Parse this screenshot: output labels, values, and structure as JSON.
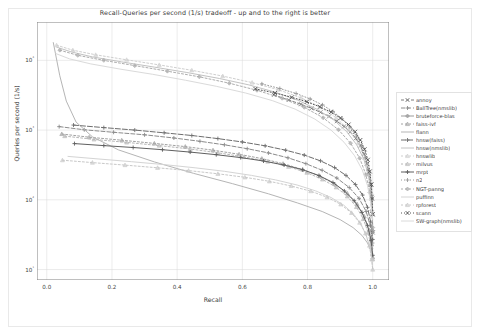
{
  "chart_data": {
    "type": "line",
    "title": "Recall-Queries per second (1/s) tradeoff - up and to the right is better",
    "xlabel": "Recall",
    "ylabel": "Queries per second (1/s)",
    "xlim": [
      -0.03,
      1.05
    ],
    "ylim_log10": [
      0.85,
      4.55
    ],
    "xscale": "linear",
    "yscale": "log",
    "grid": true,
    "xticks": [
      "0.0",
      "0.2",
      "0.4",
      "0.6",
      "0.8",
      "1.0"
    ],
    "xtick_values": [
      0.0,
      0.2,
      0.4,
      0.6,
      0.8,
      1.0
    ],
    "yticks": [
      "10⁴",
      "10³",
      "10²",
      "10¹"
    ],
    "ytick_values": [
      10000,
      1000,
      100,
      10
    ],
    "legend_position": "right outside",
    "series": [
      {
        "name": "annoy",
        "color": "#7d7d7d",
        "marker": "star",
        "dash": "3,2",
        "points": [
          [
            0.697,
            3200
          ],
          [
            0.742,
            2700
          ],
          [
            0.78,
            2350
          ],
          [
            0.812,
            2050
          ],
          [
            0.84,
            1800
          ],
          [
            0.866,
            1570
          ],
          [
            0.89,
            1340
          ],
          [
            0.912,
            1130
          ],
          [
            0.931,
            940
          ],
          [
            0.948,
            760
          ],
          [
            0.962,
            600
          ],
          [
            0.973,
            455
          ],
          [
            0.982,
            330
          ],
          [
            0.989,
            235
          ],
          [
            0.994,
            165
          ],
          [
            0.997,
            110
          ],
          [
            0.999,
            62
          ],
          [
            1.0,
            34
          ]
        ]
      },
      {
        "name": "BallTree(nmslib)",
        "color": "#8c8c8c",
        "marker": "plus",
        "dash": "4,2",
        "points": [
          [
            0.038,
            1120
          ],
          [
            0.115,
            1010
          ],
          [
            0.205,
            930
          ],
          [
            0.3,
            855
          ],
          [
            0.39,
            770
          ],
          [
            0.47,
            690
          ],
          [
            0.545,
            615
          ],
          [
            0.615,
            540
          ],
          [
            0.68,
            470
          ],
          [
            0.74,
            400
          ],
          [
            0.795,
            330
          ],
          [
            0.845,
            265
          ],
          [
            0.89,
            205
          ],
          [
            0.928,
            150
          ],
          [
            0.958,
            105
          ],
          [
            0.98,
            68
          ],
          [
            0.993,
            42
          ],
          [
            0.999,
            24
          ]
        ]
      },
      {
        "name": "bruteforce-blas",
        "color": "#9b9b9b",
        "marker": "diamond",
        "dash": "none",
        "points": [
          [
            1.0,
            36
          ]
        ]
      },
      {
        "name": "faiss-ivf",
        "color": "#a2a2a2",
        "marker": "tri",
        "dash": "2,2",
        "points": [
          [
            0.046,
            880
          ],
          [
            0.13,
            790
          ],
          [
            0.23,
            715
          ],
          [
            0.33,
            645
          ],
          [
            0.425,
            580
          ],
          [
            0.51,
            515
          ],
          [
            0.59,
            450
          ],
          [
            0.66,
            390
          ],
          [
            0.725,
            330
          ],
          [
            0.785,
            272
          ],
          [
            0.838,
            218
          ],
          [
            0.884,
            168
          ],
          [
            0.922,
            124
          ],
          [
            0.952,
            87
          ],
          [
            0.974,
            58
          ],
          [
            0.989,
            37
          ],
          [
            0.997,
            23
          ],
          [
            1.0,
            15
          ]
        ]
      },
      {
        "name": "flann",
        "color": "#b5b5b5",
        "marker": "none",
        "dash": "none",
        "points": [
          [
            0.02,
            18000
          ],
          [
            0.04,
            6000
          ],
          [
            0.06,
            2600
          ],
          [
            0.09,
            1300
          ],
          [
            0.14,
            800
          ],
          [
            0.22,
            520
          ],
          [
            0.33,
            350
          ],
          [
            0.45,
            240
          ],
          [
            0.57,
            170
          ],
          [
            0.68,
            122
          ],
          [
            0.77,
            90
          ],
          [
            0.845,
            68
          ],
          [
            0.9,
            52
          ],
          [
            0.94,
            40
          ],
          [
            0.967,
            31
          ],
          [
            0.984,
            24
          ],
          [
            0.994,
            19
          ],
          [
            1.0,
            15
          ]
        ]
      },
      {
        "name": "hnsw(faiss)",
        "color": "#6e6e6e",
        "marker": "plus",
        "dash": "5,2",
        "points": [
          [
            0.082,
            1180
          ],
          [
            0.175,
            1085
          ],
          [
            0.27,
            1000
          ],
          [
            0.36,
            915
          ],
          [
            0.445,
            835
          ],
          [
            0.525,
            755
          ],
          [
            0.6,
            675
          ],
          [
            0.67,
            595
          ],
          [
            0.733,
            515
          ],
          [
            0.79,
            438
          ],
          [
            0.84,
            362
          ],
          [
            0.883,
            290
          ],
          [
            0.918,
            224
          ],
          [
            0.947,
            166
          ],
          [
            0.969,
            117
          ],
          [
            0.984,
            78
          ],
          [
            0.994,
            48
          ],
          [
            1.0,
            27
          ]
        ]
      },
      {
        "name": "hnsw(nmslib)",
        "color": "#c2c2c2",
        "marker": "none",
        "dash": "none",
        "points": [
          [
            0.03,
            15500
          ],
          [
            0.075,
            13200
          ],
          [
            0.14,
            11200
          ],
          [
            0.23,
            9500
          ],
          [
            0.33,
            8000
          ],
          [
            0.43,
            6700
          ],
          [
            0.53,
            5500
          ],
          [
            0.62,
            4450
          ],
          [
            0.7,
            3500
          ],
          [
            0.77,
            2680
          ],
          [
            0.83,
            1980
          ],
          [
            0.88,
            1400
          ],
          [
            0.92,
            950
          ],
          [
            0.951,
            615
          ],
          [
            0.973,
            380
          ],
          [
            0.987,
            220
          ],
          [
            0.995,
            120
          ],
          [
            1.0,
            62
          ]
        ]
      },
      {
        "name": "hnswlib",
        "color": "#cfcfcf",
        "marker": "tri",
        "dash": "2,2",
        "points": [
          [
            0.03,
            16500
          ],
          [
            0.08,
            14000
          ],
          [
            0.15,
            12000
          ],
          [
            0.245,
            10200
          ],
          [
            0.345,
            8600
          ],
          [
            0.445,
            7200
          ],
          [
            0.54,
            5950
          ],
          [
            0.63,
            4800
          ],
          [
            0.71,
            3800
          ],
          [
            0.78,
            2900
          ],
          [
            0.84,
            2130
          ],
          [
            0.888,
            1500
          ],
          [
            0.926,
            1010
          ],
          [
            0.955,
            650
          ],
          [
            0.975,
            400
          ],
          [
            0.988,
            230
          ],
          [
            0.996,
            125
          ],
          [
            1.0,
            64
          ]
        ]
      },
      {
        "name": "milvus",
        "color": "#b8b8b8",
        "marker": "tri",
        "dash": "2,2",
        "points": [
          [
            0.055,
            820
          ],
          [
            0.145,
            735
          ],
          [
            0.245,
            665
          ],
          [
            0.345,
            600
          ],
          [
            0.44,
            535
          ],
          [
            0.525,
            472
          ],
          [
            0.605,
            412
          ],
          [
            0.678,
            354
          ],
          [
            0.742,
            298
          ],
          [
            0.798,
            245
          ],
          [
            0.846,
            196
          ],
          [
            0.888,
            151
          ],
          [
            0.922,
            112
          ],
          [
            0.95,
            79
          ],
          [
            0.971,
            53
          ],
          [
            0.986,
            34
          ],
          [
            0.995,
            21
          ],
          [
            1.0,
            14
          ]
        ]
      },
      {
        "name": "mrpt",
        "color": "#5f5f5f",
        "marker": "plus",
        "dash": "none",
        "points": [
          [
            0.085,
            640
          ],
          [
            0.175,
            600
          ],
          [
            0.265,
            562
          ],
          [
            0.355,
            523
          ],
          [
            0.44,
            484
          ],
          [
            0.52,
            444
          ],
          [
            0.595,
            403
          ],
          [
            0.665,
            360
          ],
          [
            0.728,
            316
          ],
          [
            0.785,
            270
          ],
          [
            0.835,
            223
          ],
          [
            0.878,
            177
          ],
          [
            0.913,
            134
          ],
          [
            0.943,
            97
          ],
          [
            0.967,
            66
          ],
          [
            0.984,
            43
          ],
          [
            0.995,
            26
          ],
          [
            1.0,
            16
          ]
        ]
      },
      {
        "name": "n2",
        "color": "#9a9a9a",
        "marker": "plus",
        "dash": "1,2",
        "points": [
          [
            0.66,
            4600
          ],
          [
            0.715,
            3950
          ],
          [
            0.765,
            3350
          ],
          [
            0.808,
            2800
          ],
          [
            0.846,
            2300
          ],
          [
            0.878,
            1850
          ],
          [
            0.906,
            1450
          ],
          [
            0.93,
            1110
          ],
          [
            0.95,
            820
          ],
          [
            0.966,
            585
          ],
          [
            0.978,
            400
          ],
          [
            0.987,
            265
          ],
          [
            0.993,
            168
          ],
          [
            0.997,
            102
          ],
          [
            0.999,
            60
          ],
          [
            1.0,
            34
          ]
        ]
      },
      {
        "name": "NGT-panng",
        "color": "#adadad",
        "marker": "diamond",
        "dash": "2,2",
        "points": [
          [
            0.04,
            14000
          ],
          [
            0.095,
            11800
          ],
          [
            0.175,
            10000
          ],
          [
            0.27,
            8400
          ],
          [
            0.37,
            7000
          ],
          [
            0.468,
            5800
          ],
          [
            0.56,
            4700
          ],
          [
            0.645,
            3720
          ],
          [
            0.722,
            2860
          ],
          [
            0.79,
            2120
          ],
          [
            0.848,
            1500
          ],
          [
            0.895,
            1010
          ],
          [
            0.932,
            650
          ],
          [
            0.96,
            395
          ],
          [
            0.979,
            230
          ],
          [
            0.991,
            128
          ],
          [
            0.997,
            70
          ],
          [
            1.0,
            40
          ]
        ]
      },
      {
        "name": "puffinn",
        "color": "#d4d4d4",
        "marker": "none",
        "dash": "none",
        "points": [
          [
            0.065,
            420
          ],
          [
            0.16,
            385
          ],
          [
            0.26,
            352
          ],
          [
            0.36,
            320
          ],
          [
            0.455,
            288
          ],
          [
            0.545,
            256
          ],
          [
            0.628,
            224
          ],
          [
            0.702,
            193
          ],
          [
            0.768,
            163
          ],
          [
            0.825,
            134
          ],
          [
            0.872,
            108
          ],
          [
            0.911,
            84
          ],
          [
            0.942,
            62
          ],
          [
            0.965,
            44
          ],
          [
            0.981,
            30
          ],
          [
            0.992,
            20
          ],
          [
            0.998,
            13
          ],
          [
            1.0,
            10
          ]
        ]
      },
      {
        "name": "rpforest",
        "color": "#c8c8c8",
        "marker": "tri",
        "dash": "2,2",
        "points": [
          [
            0.048,
            370
          ],
          [
            0.14,
            342
          ],
          [
            0.24,
            315
          ],
          [
            0.34,
            288
          ],
          [
            0.435,
            262
          ],
          [
            0.525,
            236
          ],
          [
            0.608,
            210
          ],
          [
            0.683,
            184
          ],
          [
            0.75,
            158
          ],
          [
            0.81,
            133
          ],
          [
            0.86,
            109
          ],
          [
            0.902,
            86
          ],
          [
            0.935,
            65
          ],
          [
            0.96,
            47
          ],
          [
            0.978,
            33
          ],
          [
            0.99,
            22
          ],
          [
            0.997,
            14
          ],
          [
            1.0,
            10
          ]
        ]
      },
      {
        "name": "scann",
        "color": "#555555",
        "marker": "x",
        "dash": "1,2",
        "points": [
          [
            0.64,
            3900
          ],
          [
            0.7,
            3400
          ],
          [
            0.752,
            2950
          ],
          [
            0.798,
            2540
          ],
          [
            0.838,
            2160
          ],
          [
            0.872,
            1810
          ],
          [
            0.901,
            1490
          ],
          [
            0.926,
            1200
          ],
          [
            0.946,
            945
          ],
          [
            0.962,
            720
          ],
          [
            0.975,
            530
          ],
          [
            0.985,
            375
          ],
          [
            0.991,
            255
          ],
          [
            0.996,
            166
          ],
          [
            0.998,
            104
          ],
          [
            1.0,
            62
          ]
        ]
      },
      {
        "name": "SW-graph(nmslib)",
        "color": "#dadada",
        "marker": "none",
        "dash": "none",
        "points": [
          [
            0.028,
            12500
          ],
          [
            0.07,
            10500
          ],
          [
            0.135,
            8900
          ],
          [
            0.225,
            7500
          ],
          [
            0.325,
            6300
          ],
          [
            0.425,
            5200
          ],
          [
            0.52,
            4250
          ],
          [
            0.61,
            3400
          ],
          [
            0.692,
            2650
          ],
          [
            0.762,
            2000
          ],
          [
            0.822,
            1440
          ],
          [
            0.872,
            1000
          ],
          [
            0.912,
            670
          ],
          [
            0.944,
            430
          ],
          [
            0.968,
            268
          ],
          [
            0.984,
            160
          ],
          [
            0.994,
            92
          ],
          [
            1.0,
            52
          ]
        ]
      }
    ]
  }
}
